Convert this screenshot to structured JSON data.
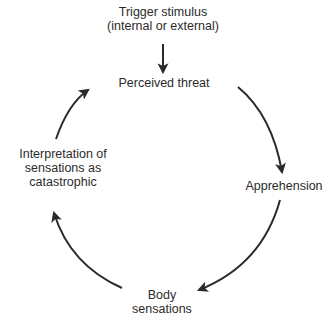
{
  "diagram": {
    "type": "cycle",
    "nodes": {
      "trigger": {
        "line1": "Trigger stimulus",
        "line2": "(internal or external)"
      },
      "perceived_threat": {
        "line1": "Perceived threat"
      },
      "apprehension": {
        "line1": "Apprehension"
      },
      "body_sensations": {
        "line1": "Body",
        "line2": "sensations"
      },
      "interpretation": {
        "line1": "Interpretation of",
        "line2": "sensations as",
        "line3": "catastrophic"
      }
    },
    "edges": [
      {
        "from": "Trigger stimulus (internal or external)",
        "to": "Perceived threat"
      },
      {
        "from": "Perceived threat",
        "to": "Apprehension"
      },
      {
        "from": "Apprehension",
        "to": "Body sensations"
      },
      {
        "from": "Body sensations",
        "to": "Interpretation of sensations as catastrophic"
      },
      {
        "from": "Interpretation of sensations as catastrophic",
        "to": "Perceived threat"
      }
    ],
    "colors": {
      "arrow": "#2a2a2a",
      "text": "#2b2b2b",
      "background": "#ffffff"
    }
  }
}
